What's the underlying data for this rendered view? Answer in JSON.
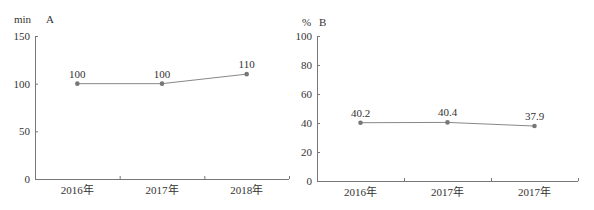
{
  "chart_data": [
    {
      "type": "line",
      "title": "",
      "unit_label": "min",
      "panel_label": "A",
      "xlabel": "",
      "ylabel": "min",
      "categories": [
        "2016年",
        "2017年",
        "2018年"
      ],
      "values": [
        100,
        100,
        110
      ],
      "data_labels": [
        "100",
        "100",
        "110"
      ],
      "ylim": [
        0,
        150
      ],
      "yticks": [
        "0",
        "50",
        "100",
        "150"
      ],
      "grid": false,
      "legend": "none"
    },
    {
      "type": "line",
      "title": "",
      "unit_label": "%",
      "panel_label": "B",
      "xlabel": "",
      "ylabel": "%",
      "categories": [
        "2016年",
        "2017年",
        "2017年"
      ],
      "values": [
        40.2,
        40.4,
        37.9
      ],
      "data_labels": [
        "40.2",
        "40.4",
        "37.9"
      ],
      "ylim": [
        0,
        100
      ],
      "yticks": [
        "0",
        "20",
        "40",
        "60",
        "80",
        "100"
      ],
      "grid": false,
      "legend": "none"
    }
  ],
  "colors": {
    "axis": "#777777",
    "line": "#888888",
    "point": "#777777",
    "text": "#333333"
  }
}
